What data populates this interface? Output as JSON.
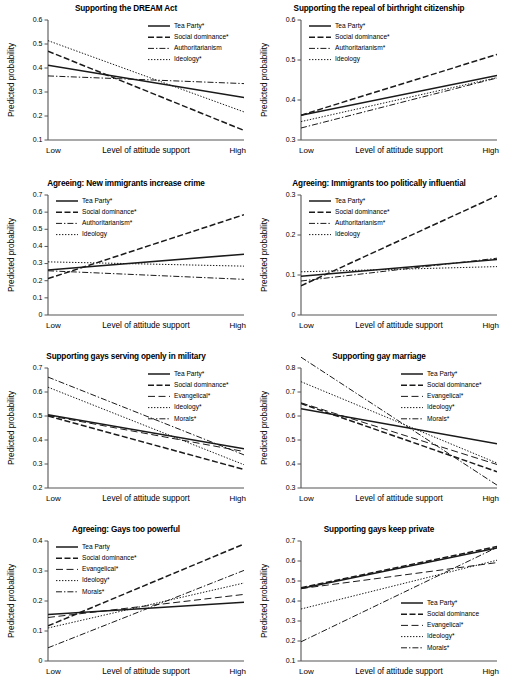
{
  "figure": {
    "axis_label_y": "Predicted probability",
    "axis_label_x": "Level of attitude support",
    "xtick_low": "Low",
    "xtick_high": "High",
    "line_color": "#1a1a1a",
    "axis_color": "#555555"
  },
  "chart_data": [
    {
      "type": "line",
      "panel": 1,
      "title": "Supporting the DREAM Act",
      "xlabel": "Level of attitude support",
      "ylabel": "Predicted probability",
      "x": [
        "Low",
        "High"
      ],
      "xlim": [
        0,
        1
      ],
      "ylim": [
        0.1,
        0.6
      ],
      "yticks": [
        "0.1",
        "0.2",
        "0.3",
        "0.4",
        "0.5",
        "0.6"
      ],
      "ytick_values": [
        0.1,
        0.2,
        0.3,
        0.4,
        0.5,
        0.6
      ],
      "grid": false,
      "legend_position": "top-right",
      "series": [
        {
          "name": "Tea Party*",
          "style": "solid",
          "values": [
            0.411,
            0.277
          ]
        },
        {
          "name": "Social dominance*",
          "style": "dashed",
          "values": [
            0.47,
            0.14
          ]
        },
        {
          "name": "Authoritarianism",
          "style": "dashdot",
          "values": [
            0.367,
            0.335
          ]
        },
        {
          "name": "Ideology*",
          "style": "dotted",
          "values": [
            0.514,
            0.217
          ]
        }
      ]
    },
    {
      "type": "line",
      "panel": 2,
      "title": "Supporting the repeal of birthright citizenship",
      "xlabel": "Level of attitude support",
      "ylabel": "Predicted probability",
      "x": [
        "Low",
        "High"
      ],
      "xlim": [
        0,
        1
      ],
      "ylim": [
        0.3,
        0.6
      ],
      "yticks": [
        "0.3",
        "0.4",
        "0.5",
        "0.6"
      ],
      "ytick_values": [
        0.3,
        0.4,
        0.5,
        0.6
      ],
      "grid": false,
      "legend_position": "top-left",
      "series": [
        {
          "name": "Tea Party*",
          "style": "solid",
          "values": [
            0.362,
            0.461
          ]
        },
        {
          "name": "Social dominance*",
          "style": "dashed",
          "values": [
            0.362,
            0.514
          ]
        },
        {
          "name": "Authoritarianism*",
          "style": "dashdot",
          "values": [
            0.33,
            0.455
          ]
        },
        {
          "name": "Ideology",
          "style": "dotted",
          "values": [
            0.346,
            0.456
          ]
        }
      ]
    },
    {
      "type": "line",
      "panel": 3,
      "title": "Agreeing: New immigrants increase crime",
      "xlabel": "Level of attitude support",
      "ylabel": "Predicted probability",
      "x": [
        "Low",
        "High"
      ],
      "xlim": [
        0,
        1
      ],
      "ylim": [
        0,
        0.7
      ],
      "yticks": [
        "0",
        "0.1",
        "0.2",
        "0.3",
        "0.4",
        "0.5",
        "0.6",
        "0.7"
      ],
      "ytick_values": [
        0,
        0.1,
        0.2,
        0.3,
        0.4,
        0.5,
        0.6,
        0.7
      ],
      "grid": false,
      "legend_position": "top-left",
      "series": [
        {
          "name": "Tea Party*",
          "style": "solid",
          "values": [
            0.262,
            0.355
          ]
        },
        {
          "name": "Social dominance*",
          "style": "dashed",
          "values": [
            0.212,
            0.585
          ]
        },
        {
          "name": "Authoritarianism*",
          "style": "dashdot",
          "values": [
            0.258,
            0.208
          ]
        },
        {
          "name": "Ideology",
          "style": "dotted",
          "values": [
            0.31,
            0.285
          ]
        }
      ]
    },
    {
      "type": "line",
      "panel": 4,
      "title": "Agreeing: Immigrants too politically influential",
      "xlabel": "Level of attitude support",
      "ylabel": "Predicted probability",
      "x": [
        "Low",
        "High"
      ],
      "xlim": [
        0,
        1
      ],
      "ylim": [
        0,
        0.3
      ],
      "yticks": [
        "0",
        "0.1",
        "0.2",
        "0.3"
      ],
      "ytick_values": [
        0,
        0.1,
        0.2,
        0.3
      ],
      "grid": false,
      "legend_position": "top-left",
      "series": [
        {
          "name": "Tea Party*",
          "style": "solid",
          "values": [
            0.097,
            0.139
          ]
        },
        {
          "name": "Social dominance*",
          "style": "dashed",
          "values": [
            0.073,
            0.298
          ]
        },
        {
          "name": "Authoritarianism*",
          "style": "dashdot",
          "values": [
            0.085,
            0.142
          ]
        },
        {
          "name": "Ideology",
          "style": "dotted",
          "values": [
            0.108,
            0.121
          ]
        }
      ]
    },
    {
      "type": "line",
      "panel": 5,
      "title": "Supporting gays serving openly in military",
      "xlabel": "Level of attitude support",
      "ylabel": "Predicted probability",
      "x": [
        "Low",
        "High"
      ],
      "xlim": [
        0,
        1
      ],
      "ylim": [
        0.2,
        0.7
      ],
      "yticks": [
        "0.2",
        "0.3",
        "0.4",
        "0.5",
        "0.6",
        "0.7"
      ],
      "ytick_values": [
        0.2,
        0.3,
        0.4,
        0.5,
        0.6,
        0.7
      ],
      "grid": false,
      "legend_position": "top-right",
      "series": [
        {
          "name": "Tea Party*",
          "style": "solid",
          "values": [
            0.505,
            0.363
          ]
        },
        {
          "name": "Social dominance*",
          "style": "dashed",
          "values": [
            0.5,
            0.277
          ]
        },
        {
          "name": "Evangelical*",
          "style": "longdash",
          "values": [
            0.502,
            0.352
          ]
        },
        {
          "name": "Ideology*",
          "style": "dotted",
          "values": [
            0.62,
            0.297
          ]
        },
        {
          "name": "Morals*",
          "style": "dashdot",
          "values": [
            0.662,
            0.338
          ]
        }
      ]
    },
    {
      "type": "line",
      "panel": 6,
      "title": "Supporting gay marriage",
      "xlabel": "Level of attitude support",
      "ylabel": "Predicted probability",
      "x": [
        "Low",
        "High"
      ],
      "xlim": [
        0,
        1
      ],
      "ylim": [
        0.3,
        0.8
      ],
      "yticks": [
        "0.3",
        "0.4",
        "0.5",
        "0.6",
        "0.7",
        "0.8"
      ],
      "ytick_values": [
        0.3,
        0.4,
        0.5,
        0.6,
        0.7,
        0.8
      ],
      "grid": false,
      "legend_position": "top-right",
      "series": [
        {
          "name": "Tea Party*",
          "style": "solid",
          "values": [
            0.63,
            0.484
          ]
        },
        {
          "name": "Social dominance*",
          "style": "dashed",
          "values": [
            0.652,
            0.368
          ]
        },
        {
          "name": "Evangelical*",
          "style": "longdash",
          "values": [
            0.655,
            0.398
          ]
        },
        {
          "name": "Ideology*",
          "style": "dotted",
          "values": [
            0.743,
            0.404
          ]
        },
        {
          "name": "Morals*",
          "style": "dashdot",
          "values": [
            0.845,
            0.312
          ]
        }
      ]
    },
    {
      "type": "line",
      "panel": 7,
      "title": "Agreeing: Gays too powerful",
      "xlabel": "Level of attitude support",
      "ylabel": "Predicted probability",
      "x": [
        "Low",
        "High"
      ],
      "xlim": [
        0,
        1
      ],
      "ylim": [
        0,
        0.4
      ],
      "yticks": [
        "0",
        "0.1",
        "0.2",
        "0.3",
        "0.4"
      ],
      "ytick_values": [
        0,
        0.1,
        0.2,
        0.3,
        0.4
      ],
      "grid": false,
      "legend_position": "top-left",
      "series": [
        {
          "name": "Tea Party",
          "style": "solid",
          "values": [
            0.155,
            0.196
          ]
        },
        {
          "name": "Social dominance*",
          "style": "dashed",
          "values": [
            0.117,
            0.39
          ]
        },
        {
          "name": "Evangelical*",
          "style": "longdash",
          "values": [
            0.145,
            0.222
          ]
        },
        {
          "name": "Ideology*",
          "style": "dotted",
          "values": [
            0.11,
            0.26
          ]
        },
        {
          "name": "Morals*",
          "style": "dashdot",
          "values": [
            0.044,
            0.302
          ]
        }
      ]
    },
    {
      "type": "line",
      "panel": 8,
      "title": "Supporting gays keep private",
      "xlabel": "Level of attitude support",
      "ylabel": "Predicted probability",
      "x": [
        "Low",
        "High"
      ],
      "xlim": [
        0,
        1
      ],
      "ylim": [
        0.1,
        0.7
      ],
      "yticks": [
        "0.1",
        "0.2",
        "0.3",
        "0.4",
        "0.5",
        "0.6",
        "0.7"
      ],
      "ytick_values": [
        0.1,
        0.2,
        0.3,
        0.4,
        0.5,
        0.6,
        0.7
      ],
      "grid": false,
      "legend_position": "bottom-right",
      "series": [
        {
          "name": "Tea Party*",
          "style": "solid",
          "values": [
            0.463,
            0.665
          ]
        },
        {
          "name": "Social dominance",
          "style": "dashed",
          "values": [
            0.466,
            0.672
          ]
        },
        {
          "name": "Evangelical*",
          "style": "longdash",
          "values": [
            0.462,
            0.592
          ]
        },
        {
          "name": "Ideology*",
          "style": "dotted",
          "values": [
            0.36,
            0.604
          ]
        },
        {
          "name": "Morals*",
          "style": "dashdot",
          "values": [
            0.196,
            0.668
          ]
        }
      ]
    }
  ]
}
